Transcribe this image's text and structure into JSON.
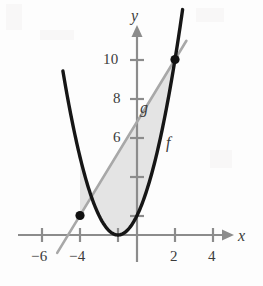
{
  "chart_data": {
    "type": "line",
    "title": "",
    "xlabel": "x",
    "ylabel": "y",
    "grid": false,
    "legend": "inline-curve-labels",
    "xlim": [
      -7.6,
      5.6
    ],
    "ylim": [
      -1.6,
      11.6
    ],
    "xticks": [
      -6,
      -4,
      -2,
      2,
      4
    ],
    "yticks": [
      2,
      4,
      6,
      8,
      10
    ],
    "xtick_labels": [
      "-6",
      "-4",
      "",
      "2",
      "4"
    ],
    "ytick_labels": [
      "",
      "",
      "6",
      "8",
      "10"
    ],
    "series": [
      {
        "name": "f",
        "label": "f",
        "kind": "parabola",
        "color": "#161616",
        "expression": "f(x) = (x + 1)^2",
        "vertex": [
          -1,
          0
        ],
        "x": [
          -3.9,
          -3.5,
          -3,
          -2.5,
          -2,
          -1.5,
          -1,
          -0.5,
          0,
          0.5,
          1,
          1.5,
          2,
          2.4
        ],
        "values": [
          8.41,
          6.25,
          4,
          2.25,
          1,
          0.25,
          0,
          0.25,
          1,
          2.25,
          4,
          6.25,
          9,
          11.56
        ]
      },
      {
        "name": "g",
        "label": "g",
        "kind": "line",
        "color": "#a8a8a8",
        "expression": "g(x) = 1.6x + 5.8",
        "slope": 1.6,
        "intercept": 5.8,
        "x": [
          -4.2,
          2.6
        ],
        "values": [
          -0.92,
          9.96
        ]
      }
    ],
    "shaded_region": {
      "label": "area between g and f",
      "color": "#e4e4e4",
      "from_x": -3,
      "to_x": 2
    },
    "points": [
      {
        "label": "",
        "x": -3,
        "y": 1
      },
      {
        "label": "",
        "x": 2,
        "y": 9
      }
    ]
  },
  "labels": {
    "x_axis": "x",
    "y_axis": "y",
    "curve_f": "f",
    "curve_g": "g",
    "tick_neg6": "−6",
    "tick_neg4": "−4",
    "tick_2": "2",
    "tick_4": "4",
    "tick_6": "6",
    "tick_8": "8",
    "tick_10": "10"
  },
  "colors": {
    "background": "#fdfdfd",
    "axis": "#8c8c8c",
    "curve_f": "#161616",
    "curve_g": "#a8a8a8",
    "shading": "#e4e4e4",
    "point": "#111111",
    "text": "#3b3b3b"
  }
}
